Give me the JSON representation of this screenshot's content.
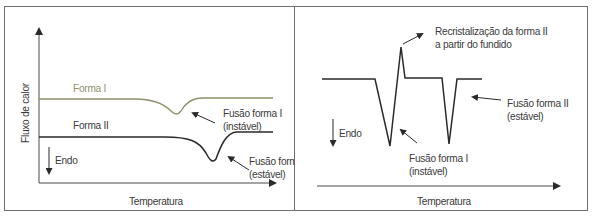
{
  "left_panel": {
    "y_axis_label": "Fluxo de calor",
    "x_axis_label": "Temperatura",
    "endo_label": "Endo",
    "curves": [
      {
        "name": "Forma I",
        "color": "#8f9069",
        "annotation_line1": "Fusão forma I",
        "annotation_line2": "(instável)"
      },
      {
        "name": "Forma II",
        "color": "#2a2a2a",
        "annotation_line1": "Fusão forma II",
        "annotation_line2": "(estável)"
      }
    ]
  },
  "right_panel": {
    "x_axis_label": "Temperatura",
    "endo_label": "Endo",
    "annotations": {
      "recrystallization_line1": "Recristalização da forma II",
      "recrystallization_line2": "a partir do fundido",
      "fusion_stable_line1": "Fusão forma II",
      "fusion_stable_line2": "(estável)",
      "fusion_unstable_line1": "Fusão forma I",
      "fusion_unstable_line2": "(instável)"
    }
  },
  "colors": {
    "border": "#6f6f6f",
    "line": "#2a2a2a",
    "forma_i": "#8f9069",
    "text": "#3a3a3a"
  }
}
